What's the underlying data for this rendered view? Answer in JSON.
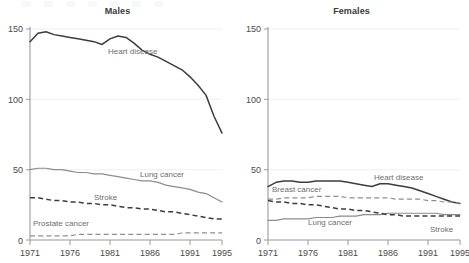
{
  "figure": {
    "background": "#ffffff",
    "axis_color": "#9a9a9a",
    "grid_color": "#efefef",
    "dark_series_color": "#3d3d3d",
    "light_series_color": "#8c8c8c"
  },
  "panels": [
    {
      "id": "males",
      "title": "Males"
    },
    {
      "id": "females",
      "title": "Females"
    }
  ],
  "axis": {
    "y_ticks": [
      "0",
      "50",
      "100",
      "150"
    ],
    "x_ticks": [
      "1971",
      "1976",
      "1981",
      "1986",
      "1991",
      "1995"
    ]
  },
  "labels": {
    "males_heart": "Heart disease",
    "males_lung": "Lung cancer",
    "males_stroke": "Stroke",
    "males_prostate": "Prostate cancer",
    "females_heart": "Heart disease",
    "females_breast": "Breast cancer",
    "females_lung": "Lung cancer",
    "females_stroke": "Stroke"
  },
  "chart_data": {
    "type": "line",
    "title": "",
    "xlabel": "",
    "ylabel": "",
    "xlim": [
      1971,
      1995
    ],
    "ylim": [
      0,
      150
    ],
    "yticks": [
      0,
      50,
      100,
      150
    ],
    "xticks": [
      1971,
      1976,
      1981,
      1986,
      1991,
      1995
    ],
    "grid": "horizontal",
    "legend": "inline-annotations",
    "panels": [
      {
        "name": "Males",
        "x": [
          1971,
          1972,
          1973,
          1974,
          1975,
          1976,
          1977,
          1978,
          1979,
          1980,
          1981,
          1982,
          1983,
          1984,
          1985,
          1986,
          1987,
          1988,
          1989,
          1990,
          1991,
          1992,
          1993,
          1994,
          1995
        ],
        "series": [
          {
            "name": "Heart disease",
            "style": "solid-dark",
            "values": [
              141,
              147,
              148,
              146,
              145,
              144,
              143,
              142,
              141,
              139,
              143,
              145,
              144,
              140,
              135,
              132,
              130,
              127,
              124,
              121,
              116,
              110,
              103,
              88,
              76
            ]
          },
          {
            "name": "Lung cancer",
            "style": "solid-light",
            "values": [
              50,
              51,
              51,
              50,
              50,
              49,
              48,
              48,
              47,
              47,
              46,
              45,
              44,
              43,
              42,
              42,
              41,
              39,
              38,
              37,
              36,
              34,
              33,
              30,
              27
            ]
          },
          {
            "name": "Stroke",
            "style": "dashed-dark",
            "values": [
              30,
              30,
              29,
              28,
              28,
              27,
              27,
              26,
              26,
              25,
              25,
              24,
              23,
              23,
              22,
              22,
              21,
              20,
              20,
              19,
              18,
              17,
              16,
              15,
              15
            ]
          },
          {
            "name": "Prostate cancer",
            "style": "dashed-light",
            "values": [
              3,
              3,
              3,
              3,
              3,
              3,
              4,
              4,
              4,
              4,
              4,
              4,
              4,
              4,
              4,
              4,
              4,
              4,
              4,
              5,
              5,
              5,
              5,
              5,
              5
            ]
          }
        ]
      },
      {
        "name": "Females",
        "x": [
          1971,
          1972,
          1973,
          1974,
          1975,
          1976,
          1977,
          1978,
          1979,
          1980,
          1981,
          1982,
          1983,
          1984,
          1985,
          1986,
          1987,
          1988,
          1989,
          1990,
          1991,
          1992,
          1993,
          1994,
          1995
        ],
        "series": [
          {
            "name": "Heart disease",
            "style": "solid-dark",
            "values": [
              38,
              41,
              42,
              42,
              41,
              41,
              42,
              42,
              42,
              42,
              41,
              40,
              39,
              38,
              40,
              40,
              39,
              38,
              37,
              35,
              33,
              31,
              29,
              27,
              26
            ]
          },
          {
            "name": "Breast cancer",
            "style": "dashed-light",
            "values": [
              29,
              29,
              30,
              30,
              30,
              30,
              31,
              31,
              31,
              31,
              30,
              30,
              30,
              30,
              30,
              30,
              29,
              29,
              29,
              29,
              28,
              28,
              27,
              27,
              26
            ]
          },
          {
            "name": "Lung cancer",
            "style": "solid-light",
            "values": [
              14,
              14,
              15,
              15,
              15,
              15,
              16,
              16,
              16,
              17,
              17,
              17,
              18,
              18,
              18,
              19,
              19,
              19,
              19,
              19,
              19,
              19,
              18,
              18,
              18
            ]
          },
          {
            "name": "Stroke",
            "style": "dashed-dark",
            "values": [
              28,
              27,
              27,
              26,
              26,
              25,
              25,
              24,
              23,
              22,
              22,
              21,
              21,
              20,
              19,
              18,
              18,
              17,
              17,
              17,
              17,
              17,
              17,
              17,
              17
            ]
          }
        ]
      }
    ]
  }
}
